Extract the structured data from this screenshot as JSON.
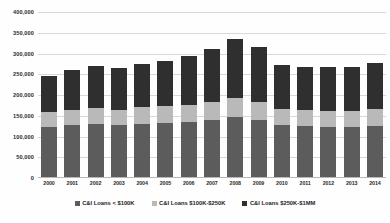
{
  "chart_data": {
    "type": "bar",
    "subtype": "stacked-vertical",
    "title": "",
    "subtitle": "",
    "xlabel": "",
    "ylabel": "",
    "grid": true,
    "legend_position": "bottom",
    "ylim": [
      0,
      400000
    ],
    "ytick_step": 50000,
    "ytick_labels": [
      "400,000",
      "350,000",
      "300,000",
      "250,000",
      "200,000",
      "150,000",
      "100,000",
      "50,000",
      "0"
    ],
    "ytick_values": [
      400000,
      350000,
      300000,
      250000,
      200000,
      150000,
      100000,
      50000,
      0
    ],
    "categories": [
      "2000",
      "2001",
      "2002",
      "2003",
      "2004",
      "2005",
      "2006",
      "2007",
      "2008",
      "2009",
      "2010",
      "2011",
      "2012",
      "2013",
      "2014"
    ],
    "series": [
      {
        "name": "C&I Loans < $100K",
        "color": "#5c5c5c",
        "stack_position": "bottom",
        "values": [
          122000,
          127000,
          130000,
          128000,
          131000,
          133000,
          135000,
          141000,
          147000,
          140000,
          128000,
          125000,
          124000,
          123000,
          126000
        ]
      },
      {
        "name": "C&I Loans $100K-$250K",
        "color": "#b9b9b9",
        "stack_position": "middle",
        "values": [
          36000,
          37000,
          38000,
          37000,
          39000,
          40000,
          41000,
          43000,
          45000,
          44000,
          39000,
          38000,
          38000,
          38000,
          40000
        ]
      },
      {
        "name": "C&I Loans $250K-$1MM",
        "color": "#2f2f2f",
        "stack_position": "top",
        "values": [
          89000,
          97000,
          102000,
          100000,
          105000,
          110000,
          117000,
          127000,
          144000,
          132000,
          106000,
          104000,
          106000,
          107000,
          112000
        ]
      }
    ],
    "totals": [
      247000,
      261000,
      270000,
      265000,
      275000,
      283000,
      293000,
      311000,
      336000,
      316000,
      273000,
      267000,
      268000,
      268000,
      278000
    ]
  },
  "legend": {
    "items": [
      {
        "label": "C&I Loans < $100K",
        "color": "#5c5c5c"
      },
      {
        "label": "C&I Loans $100K-$250K",
        "color": "#b9b9b9"
      },
      {
        "label": "C&I Loans $250K-$1MM",
        "color": "#2f2f2f"
      }
    ]
  }
}
